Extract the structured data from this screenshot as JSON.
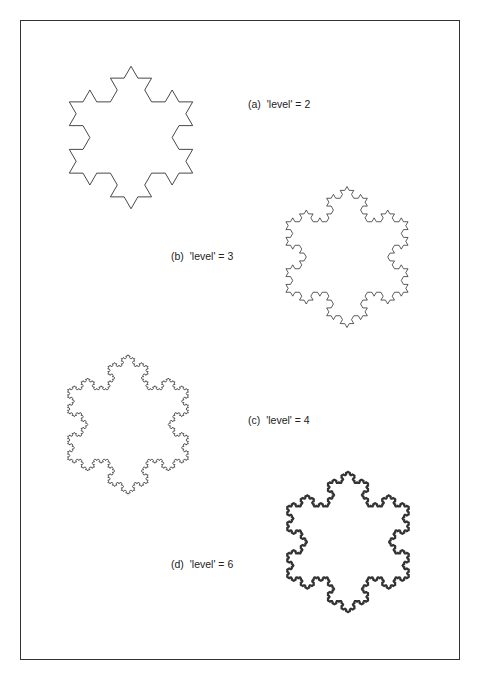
{
  "figure": {
    "frame_color": "#333333",
    "line_color": "#333333",
    "panels": [
      {
        "id": "a",
        "tag": "(a)",
        "expr": "'level' = 2",
        "level": 2,
        "cx": 131,
        "cy": 137.5,
        "r": 95,
        "stroke": 0.9,
        "label_x": 248,
        "label_y": 98
      },
      {
        "id": "b",
        "tag": "(b)",
        "expr": "'level' = 3",
        "level": 3,
        "cx": 347,
        "cy": 257,
        "r": 94,
        "stroke": 0.8,
        "label_x": 171,
        "label_y": 250
      },
      {
        "id": "c",
        "tag": "(c)",
        "expr": "'level' = 4",
        "level": 4,
        "cx": 128,
        "cy": 424.5,
        "r": 93,
        "stroke": 0.8,
        "label_x": 248,
        "label_y": 414
      },
      {
        "id": "d",
        "tag": "(d)",
        "expr": "'level' = 6",
        "level": 6,
        "cx": 348,
        "cy": 542,
        "r": 94,
        "stroke": 1.6,
        "label_x": 171,
        "label_y": 558
      }
    ]
  }
}
